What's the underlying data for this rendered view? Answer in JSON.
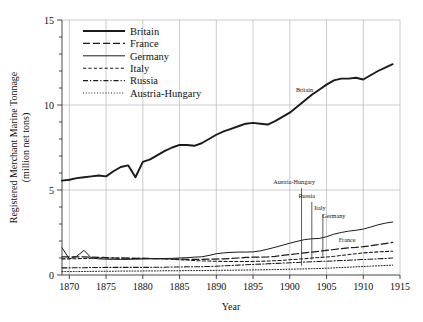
{
  "chart_data": {
    "type": "line",
    "title": "",
    "xlabel": "Year",
    "ylabel": "Registered Merchant Marine Tonnage (million net tons)",
    "ylabel_line1": "Registered Merchant Marine Tonnage",
    "ylabel_line2": "(million net tons)",
    "xlim": [
      1869,
      1915
    ],
    "ylim": [
      0,
      15
    ],
    "xticks": [
      1870,
      1875,
      1880,
      1885,
      1890,
      1895,
      1900,
      1905,
      1910,
      1915
    ],
    "xtick_labels": [
      "1870",
      "1875",
      "1880",
      "1885",
      "1890",
      "1895",
      "1900",
      "1905",
      "1910",
      "1915"
    ],
    "yticks": [
      0,
      5,
      10,
      15
    ],
    "ytick_labels": [
      "0",
      "5",
      "10",
      "15"
    ],
    "y_minor_step": 1,
    "grid": true,
    "grid_color": "#b4b4b4",
    "legend_position": "top-left-inside",
    "units": "million net tons",
    "series": [
      {
        "name": "Britain",
        "style": "solid",
        "width": 1.9,
        "color": "#1a1a1a",
        "x": [
          1869,
          1870,
          1871,
          1872,
          1873,
          1874,
          1875,
          1876,
          1877,
          1878,
          1879,
          1880,
          1881,
          1882,
          1883,
          1884,
          1885,
          1886,
          1887,
          1888,
          1889,
          1890,
          1891,
          1892,
          1893,
          1894,
          1895,
          1896,
          1897,
          1898,
          1899,
          1900,
          1901,
          1902,
          1903,
          1904,
          1905,
          1906,
          1907,
          1908,
          1909,
          1910,
          1911,
          1912,
          1913,
          1914
        ],
        "y": [
          5.55,
          5.6,
          5.7,
          5.75,
          5.8,
          5.85,
          5.8,
          6.1,
          6.35,
          6.45,
          5.75,
          6.65,
          6.8,
          7.05,
          7.3,
          7.5,
          7.65,
          7.65,
          7.6,
          7.75,
          8.0,
          8.25,
          8.45,
          8.6,
          8.75,
          8.9,
          8.95,
          8.9,
          8.85,
          9.05,
          9.3,
          9.55,
          9.9,
          10.25,
          10.6,
          10.9,
          11.2,
          11.45,
          11.55,
          11.55,
          11.6,
          11.5,
          11.75,
          12.0,
          12.2,
          12.4
        ]
      },
      {
        "name": "France",
        "style": "longdash",
        "width": 1.25,
        "color": "#1a1a1a",
        "x": [
          1869,
          1870,
          1871,
          1872,
          1873,
          1874,
          1875,
          1876,
          1877,
          1878,
          1879,
          1880,
          1881,
          1882,
          1883,
          1884,
          1885,
          1886,
          1887,
          1888,
          1889,
          1890,
          1891,
          1892,
          1893,
          1894,
          1895,
          1896,
          1897,
          1898,
          1899,
          1900,
          1901,
          1902,
          1903,
          1904,
          1905,
          1906,
          1907,
          1908,
          1909,
          1910,
          1911,
          1912,
          1913,
          1914
        ],
        "y": [
          1.07,
          1.07,
          1.07,
          1.07,
          1.05,
          1.04,
          1.02,
          1.0,
          0.99,
          0.99,
          0.98,
          0.98,
          0.97,
          0.96,
          0.95,
          0.94,
          0.93,
          0.92,
          0.92,
          0.92,
          0.93,
          0.94,
          0.95,
          0.97,
          1.0,
          1.03,
          1.05,
          1.05,
          1.06,
          1.1,
          1.15,
          1.2,
          1.25,
          1.3,
          1.35,
          1.4,
          1.45,
          1.5,
          1.55,
          1.6,
          1.63,
          1.67,
          1.72,
          1.78,
          1.85,
          1.92
        ]
      },
      {
        "name": "Germany",
        "style": "solid",
        "width": 1.0,
        "color": "#1a1a1a",
        "x": [
          1869,
          1870,
          1871,
          1872,
          1873,
          1874,
          1875,
          1876,
          1877,
          1878,
          1879,
          1880,
          1881,
          1882,
          1883,
          1884,
          1885,
          1886,
          1887,
          1888,
          1889,
          1890,
          1891,
          1892,
          1893,
          1894,
          1895,
          1896,
          1897,
          1898,
          1899,
          1900,
          1901,
          1902,
          1903,
          1904,
          1905,
          1906,
          1907,
          1908,
          1909,
          1910,
          1911,
          1912,
          1913,
          1914
        ],
        "y": [
          1.6,
          0.95,
          1.1,
          1.45,
          1.0,
          0.95,
          0.93,
          0.92,
          0.92,
          0.92,
          0.93,
          0.94,
          0.95,
          0.96,
          0.97,
          0.98,
          1.0,
          1.02,
          1.05,
          1.07,
          1.15,
          1.25,
          1.3,
          1.33,
          1.35,
          1.35,
          1.36,
          1.42,
          1.52,
          1.63,
          1.75,
          1.87,
          1.98,
          2.08,
          2.13,
          2.15,
          2.25,
          2.4,
          2.5,
          2.58,
          2.63,
          2.7,
          2.82,
          2.95,
          3.05,
          3.12
        ]
      },
      {
        "name": "Italy",
        "style": "shortdash",
        "width": 1.05,
        "color": "#1a1a1a",
        "x": [
          1869,
          1870,
          1871,
          1872,
          1873,
          1874,
          1875,
          1876,
          1877,
          1878,
          1879,
          1880,
          1881,
          1882,
          1883,
          1884,
          1885,
          1886,
          1887,
          1888,
          1889,
          1890,
          1891,
          1892,
          1893,
          1894,
          1895,
          1896,
          1897,
          1898,
          1899,
          1900,
          1901,
          1902,
          1903,
          1904,
          1905,
          1906,
          1907,
          1908,
          1909,
          1910,
          1911,
          1912,
          1913,
          1914
        ],
        "y": [
          0.95,
          0.95,
          0.96,
          0.97,
          0.98,
          0.99,
          1.0,
          1.0,
          1.0,
          0.99,
          0.99,
          0.98,
          0.97,
          0.96,
          0.95,
          0.93,
          0.9,
          0.88,
          0.85,
          0.83,
          0.82,
          0.81,
          0.8,
          0.8,
          0.8,
          0.8,
          0.8,
          0.81,
          0.82,
          0.84,
          0.86,
          0.9,
          0.93,
          0.96,
          1.0,
          1.03,
          1.06,
          1.1,
          1.15,
          1.2,
          1.25,
          1.3,
          1.33,
          1.36,
          1.38,
          1.4
        ]
      },
      {
        "name": "Russia",
        "style": "dashdot",
        "width": 1.05,
        "color": "#1a1a1a",
        "x": [
          1869,
          1870,
          1871,
          1872,
          1873,
          1874,
          1875,
          1876,
          1877,
          1878,
          1879,
          1880,
          1881,
          1882,
          1883,
          1884,
          1885,
          1886,
          1887,
          1888,
          1889,
          1890,
          1891,
          1892,
          1893,
          1894,
          1895,
          1896,
          1897,
          1898,
          1899,
          1900,
          1901,
          1902,
          1903,
          1904,
          1905,
          1906,
          1907,
          1908,
          1909,
          1910,
          1911,
          1912,
          1913,
          1914
        ],
        "y": [
          0.42,
          0.42,
          0.43,
          0.43,
          0.44,
          0.44,
          0.45,
          0.45,
          0.45,
          0.45,
          0.45,
          0.45,
          0.45,
          0.46,
          0.46,
          0.47,
          0.47,
          0.48,
          0.48,
          0.49,
          0.5,
          0.52,
          0.54,
          0.56,
          0.58,
          0.6,
          0.62,
          0.64,
          0.66,
          0.68,
          0.7,
          0.72,
          0.74,
          0.76,
          0.78,
          0.8,
          0.81,
          0.83,
          0.85,
          0.87,
          0.89,
          0.91,
          0.93,
          0.95,
          0.97,
          1.0
        ]
      },
      {
        "name": "Austria-Hungary",
        "style": "dotted",
        "width": 1.0,
        "color": "#1a1a1a",
        "x": [
          1869,
          1870,
          1871,
          1872,
          1873,
          1874,
          1875,
          1876,
          1877,
          1878,
          1879,
          1880,
          1881,
          1882,
          1883,
          1884,
          1885,
          1886,
          1887,
          1888,
          1889,
          1890,
          1891,
          1892,
          1893,
          1894,
          1895,
          1896,
          1897,
          1898,
          1899,
          1900,
          1901,
          1902,
          1903,
          1904,
          1905,
          1906,
          1907,
          1908,
          1909,
          1910,
          1911,
          1912,
          1913,
          1914
        ],
        "y": [
          0.2,
          0.2,
          0.2,
          0.21,
          0.21,
          0.22,
          0.22,
          0.22,
          0.23,
          0.23,
          0.23,
          0.24,
          0.24,
          0.24,
          0.25,
          0.25,
          0.25,
          0.26,
          0.26,
          0.26,
          0.27,
          0.27,
          0.28,
          0.28,
          0.29,
          0.29,
          0.3,
          0.3,
          0.31,
          0.32,
          0.33,
          0.34,
          0.35,
          0.36,
          0.37,
          0.38,
          0.4,
          0.42,
          0.44,
          0.46,
          0.48,
          0.5,
          0.52,
          0.54,
          0.56,
          0.58
        ]
      }
    ],
    "annotations": [
      {
        "text": "Britain",
        "x": 1902.0,
        "y": 10.75,
        "leader": false
      },
      {
        "text": "Austria-Hungary",
        "x": 1900.6,
        "y": 5.35,
        "leader": true,
        "leader_x": 1901.6,
        "leader_y0": 5.1,
        "leader_y1": 0.55
      },
      {
        "text": "Russia",
        "x": 1902.3,
        "y": 4.55,
        "leader": true,
        "leader_x": 1903.0,
        "leader_y0": 4.3,
        "leader_y1": 0.9
      },
      {
        "text": "Italy",
        "x": 1904.1,
        "y": 3.85,
        "leader": true,
        "leader_x": 1904.5,
        "leader_y0": 3.6,
        "leader_y1": 1.12
      },
      {
        "text": "Germany",
        "x": 1906.0,
        "y": 3.35,
        "leader": false
      },
      {
        "text": "France",
        "x": 1907.8,
        "y": 1.95,
        "leader": false
      }
    ],
    "legend": [
      {
        "label": "Britain",
        "style": "solid",
        "width": 1.9
      },
      {
        "label": "France",
        "style": "longdash",
        "width": 1.25
      },
      {
        "label": "Germany",
        "style": "solid",
        "width": 1.0
      },
      {
        "label": "Italy",
        "style": "shortdash",
        "width": 1.05
      },
      {
        "label": "Russia",
        "style": "dashdot",
        "width": 1.05
      },
      {
        "label": "Austria-Hungary",
        "style": "dotted",
        "width": 1.0
      }
    ]
  }
}
